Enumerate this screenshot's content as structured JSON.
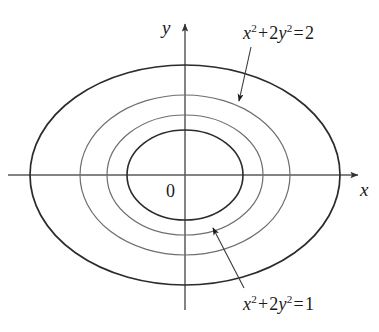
{
  "figure": {
    "width": 379,
    "height": 332,
    "background_color": "#ffffff"
  },
  "axes": {
    "x_label": "x",
    "y_label": "y",
    "origin_label": "0",
    "origin_px": {
      "x": 185,
      "y": 175
    },
    "x_axis": {
      "x1": 8,
      "y1": 175,
      "x2": 360,
      "y2": 175,
      "arrow_at": "right"
    },
    "y_axis": {
      "x1": 185,
      "y1": 310,
      "x2": 185,
      "y2": 22,
      "arrow_at": "top"
    },
    "color": "#5a5a5a"
  },
  "annotations": [
    {
      "id": "eq-outer",
      "text_parts": {
        "x": "x",
        "xe": "2",
        "plus": "+",
        "coef": "2",
        "y": "y",
        "ye": "2",
        "eq": "=",
        "value": "2"
      },
      "plain_text": "x^2 + 2y^2 = 2",
      "label_px": {
        "x": 243,
        "y": 24
      },
      "leader": {
        "x1": 251,
        "y1": 47,
        "x2": 239,
        "y2": 101,
        "arrow_at": "end"
      }
    },
    {
      "id": "eq-inner",
      "text_parts": {
        "x": "x",
        "xe": "2",
        "plus": "+",
        "coef": "2",
        "y": "y",
        "ye": "2",
        "eq": "=",
        "value": "1"
      },
      "plain_text": "x^2 + 2y^2 = 1",
      "label_px": {
        "x": 243,
        "y": 295
      },
      "leader": {
        "x1": 244,
        "y1": 288,
        "x2": 213,
        "y2": 228,
        "arrow_at": "end"
      }
    }
  ],
  "chart_data": {
    "type": "line",
    "title": "",
    "subtitle": "",
    "xlabel": "x",
    "ylabel": "y",
    "grid": false,
    "legend": "none",
    "axis_arrows": true,
    "center": {
      "x": 0,
      "y": 0
    },
    "curve_family": "x^2 + 2y^2 = k",
    "series": [
      {
        "name": "k = 0.25",
        "k": 0.25,
        "semi_axis_x": 0.5,
        "semi_axis_y": 0.3536,
        "px": {
          "cx": 185,
          "cy": 175,
          "rx": 58,
          "ry": 45
        },
        "stroke": "#2b2b2b",
        "stroke_width": 1.6,
        "labeled": false
      },
      {
        "name": "k = 0.45",
        "k": 0.45,
        "semi_axis_x": 0.6708,
        "semi_axis_y": 0.4743,
        "px": {
          "cx": 185,
          "cy": 175,
          "rx": 78,
          "ry": 60
        },
        "stroke": "#6d6d6d",
        "stroke_width": 1.2,
        "labeled": true,
        "label_ref": "eq-inner"
      },
      {
        "name": "k = 0.82",
        "k": 0.82,
        "semi_axis_x": 0.9055,
        "semi_axis_y": 0.6403,
        "px": {
          "cx": 185,
          "cy": 175,
          "rx": 105,
          "ry": 80
        },
        "stroke": "#6d6d6d",
        "stroke_width": 1.2,
        "labeled": true,
        "label_ref": "eq-outer"
      },
      {
        "name": "k = 2",
        "k": 2,
        "semi_axis_x": 1.4142,
        "semi_axis_y": 1.0,
        "px": {
          "cx": 185,
          "cy": 175,
          "rx": 155,
          "ry": 110
        },
        "stroke": "#2b2b2b",
        "stroke_width": 1.7,
        "labeled": false
      }
    ],
    "xlim": [
      -1.7,
      1.7
    ],
    "ylim": [
      -1.25,
      1.25
    ]
  }
}
